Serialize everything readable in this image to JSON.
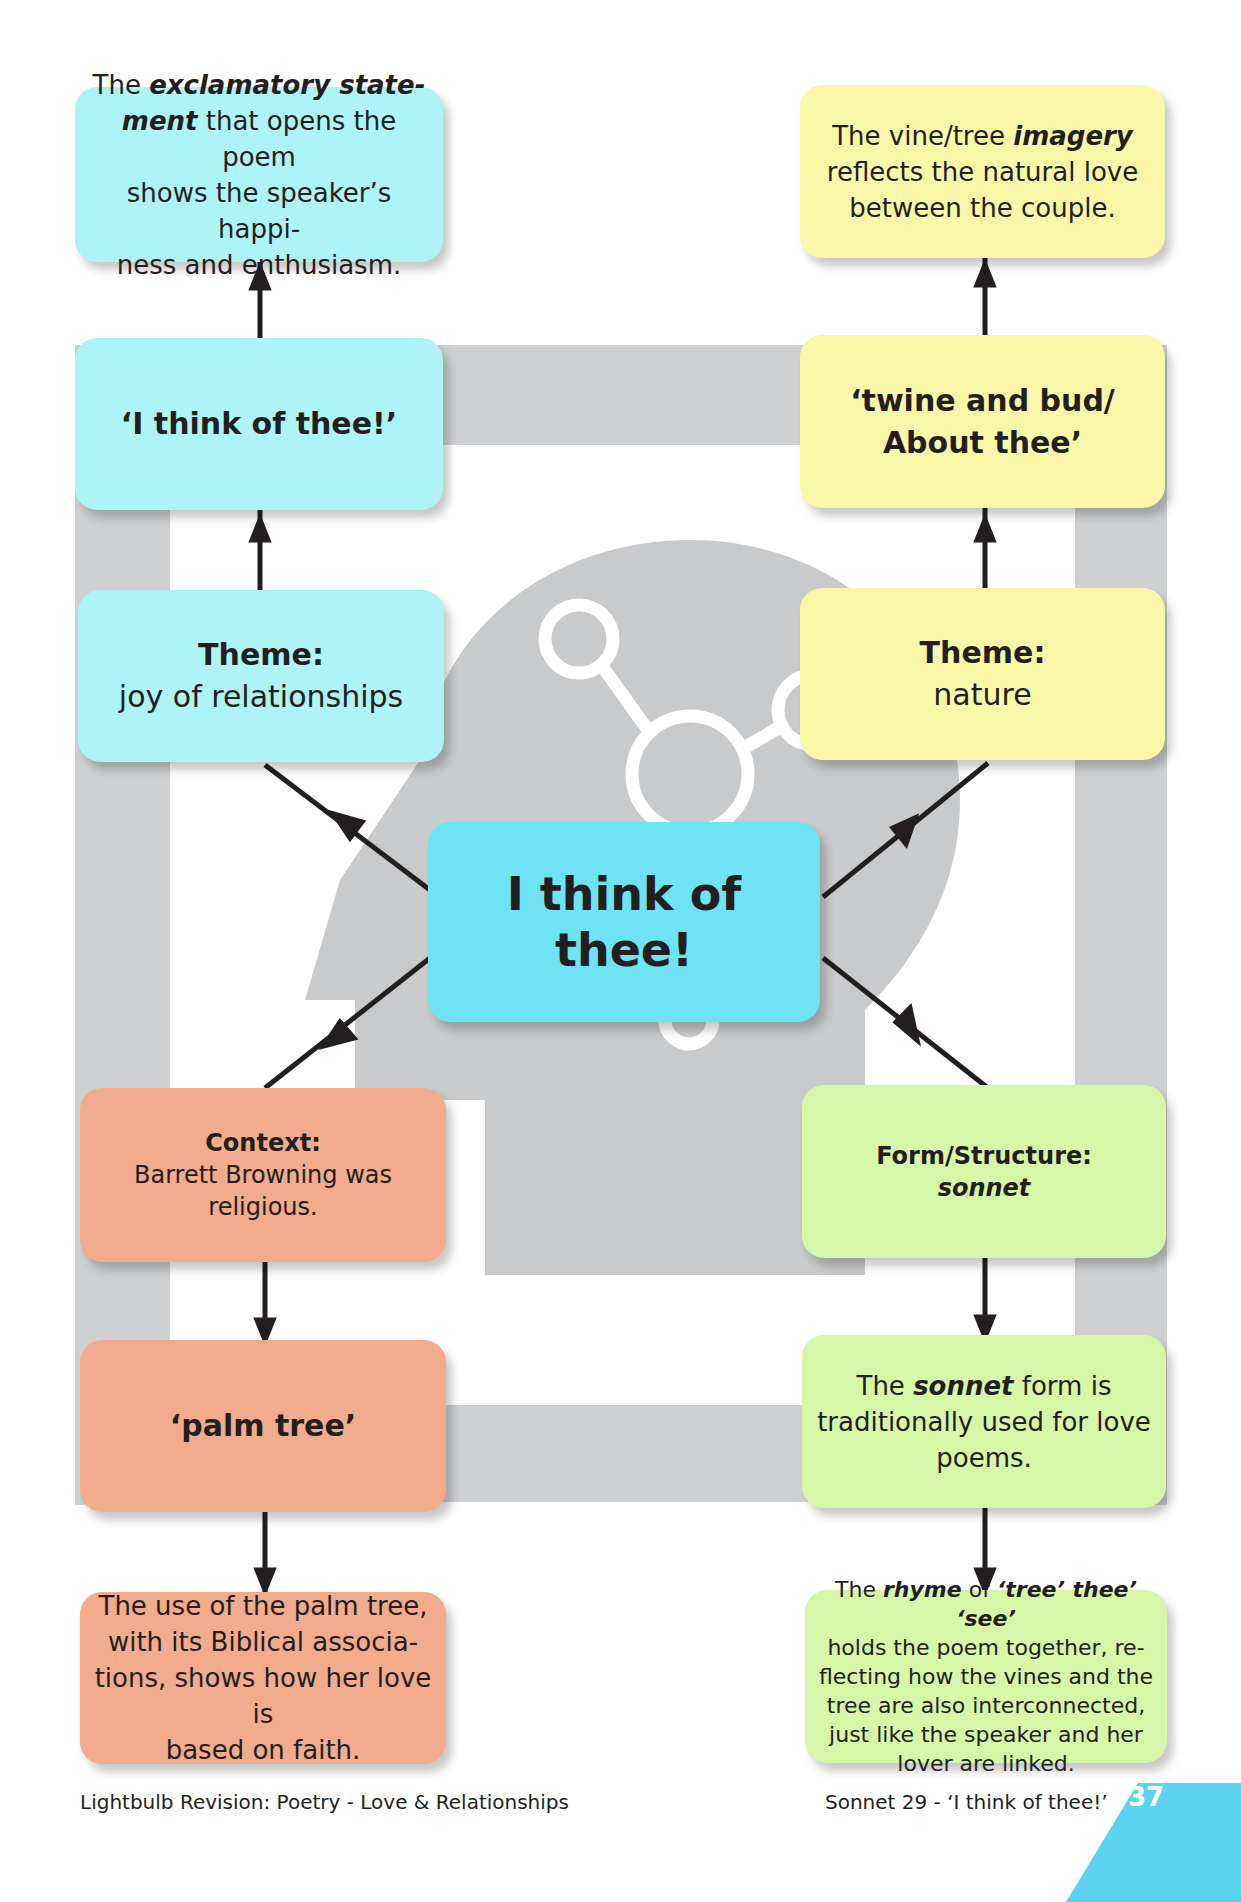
{
  "central": {
    "line1": "I think of",
    "line2": "thee!"
  },
  "left_column": {
    "color": "#aef3f6",
    "boxes": [
      {
        "segments": [
          {
            "text": "The "
          },
          {
            "text": "exclamatory state-",
            "style": "bold-italic"
          },
          {
            "text": "ment",
            "style": "bold-italic"
          },
          {
            "text": " that opens the poem shows the speaker’s happi-ness and enthusiasm."
          }
        ],
        "plain": "The exclamatory statement that opens the poem shows the speaker’s happiness and enthusiasm.",
        "l1a": "The ",
        "l1b": "exclamatory state-",
        "l2a": "ment",
        "l2b": " that opens the poem",
        "l3": "shows the speaker’s happi-",
        "l4": "ness and enthusiasm."
      },
      {
        "text": "‘I think of thee!’"
      },
      {
        "title": "Theme:",
        "body": "joy of relationships"
      }
    ]
  },
  "right_column": {
    "color": "#fbf7a8",
    "boxes": [
      {
        "l1a": "The vine/tree ",
        "l1b": "imagery",
        "l2": "reflects the natural love",
        "l3": "between the couple."
      },
      {
        "l1": "‘twine and bud/",
        "l2": "About thee’"
      },
      {
        "title": "Theme:",
        "body": "nature"
      }
    ]
  },
  "bottom_left": {
    "color": "#f2ab8c",
    "boxes": [
      {
        "title": "Context:",
        "l1": "Barrett Browning was",
        "l2": "religious."
      },
      {
        "text": "‘palm tree’"
      },
      {
        "l1": "The use of the palm tree,",
        "l2": "with its Biblical associa-",
        "l3": "tions, shows how her love is",
        "l4": "based on faith."
      }
    ]
  },
  "bottom_right": {
    "color": "#d6f7a7",
    "boxes": [
      {
        "title": "Form/Structure:",
        "body": "sonnet"
      },
      {
        "l1a": "The ",
        "l1b": "sonnet",
        "l1c": " form is",
        "l2": "traditionally used for love",
        "l3": "poems."
      },
      {
        "l1a": "The ",
        "l1b": "rhyme",
        "l1c": " of ",
        "l1d": "‘tree’ thee’ ‘see’",
        "l2": "holds the poem together, re-",
        "l3": "flecting how the vines and the",
        "l4": "tree are also interconnected,",
        "l5": "just like the speaker and her",
        "l6": "lover are linked."
      }
    ]
  },
  "footer": {
    "left": "Lightbulb Revision: Poetry - Love & Relationships",
    "right": "Sonnet 29 - ‘I think of thee!’",
    "page_number": "37",
    "accent_color": "#5dd3f0"
  }
}
